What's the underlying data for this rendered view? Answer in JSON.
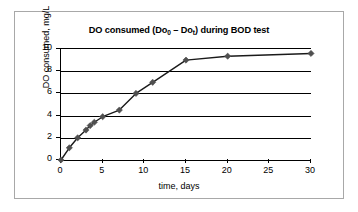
{
  "figure": {
    "border_color": "#a8a8a8",
    "background": "#ffffff"
  },
  "chart_data": {
    "type": "line",
    "title": "DO consumed (Do0 – Dot) during BOD test",
    "title_parts": {
      "prefix": "DO consumed (Do",
      "sub1": "0",
      "middle": " – Do",
      "sub2": "t",
      "suffix": ") during BOD test"
    },
    "xlabel": "time, days",
    "ylabel": "DO consumed, mg/L",
    "xlim": [
      0,
      30
    ],
    "ylim": [
      0,
      10
    ],
    "xticks": [
      0,
      5,
      10,
      15,
      20,
      25,
      30
    ],
    "xtick_labels": [
      "0",
      "5",
      "10",
      "15",
      "20",
      "25",
      "30"
    ],
    "yticks": [
      0,
      2,
      4,
      6,
      8,
      10
    ],
    "ytick_labels": [
      "0",
      "2",
      "4",
      "6",
      "8",
      "10"
    ],
    "grid": "horizontal",
    "legend": "none",
    "series": [
      {
        "name": "DO consumed",
        "marker": "diamond",
        "marker_color": "#4f4f4f",
        "line_color": "#1a1a1a",
        "x": [
          0,
          1,
          2,
          3,
          3.5,
          4,
          5,
          7,
          9,
          11,
          15,
          20,
          30
        ],
        "y": [
          0,
          1.1,
          2.0,
          2.7,
          3.1,
          3.4,
          3.9,
          4.5,
          6.0,
          7.0,
          9.0,
          9.35,
          9.6
        ]
      }
    ]
  }
}
